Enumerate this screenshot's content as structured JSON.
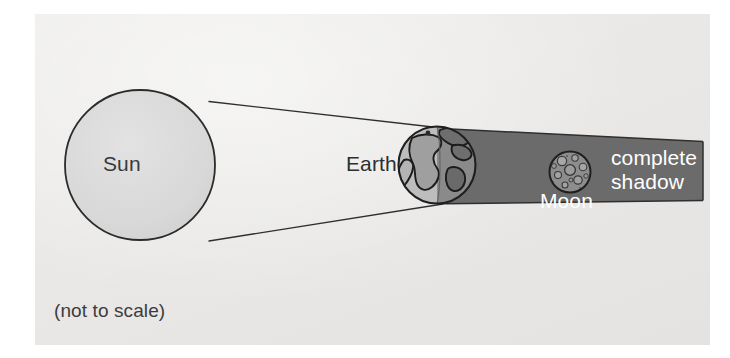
{
  "diagram": {
    "type": "astronomy-diagram",
    "caption": "(not to scale)",
    "background_color": "#f0efed",
    "bodies": [
      {
        "name": "Sun",
        "label": "Sun",
        "icon": "sun-circle-icon",
        "cx": 140,
        "cy": 165,
        "r": 75,
        "fill": "#d9d9d9",
        "stroke": "#2b2b2b"
      },
      {
        "name": "Earth",
        "label": "Earth",
        "icon": "earth-globe-icon",
        "cx": 437,
        "cy": 165,
        "r": 39,
        "fill_lit": "#b7b7b7",
        "fill_dark": "#7a7a7a",
        "stroke": "#1f1f1f"
      },
      {
        "name": "Moon",
        "label": "Moon",
        "icon": "moon-cratered-circle-icon",
        "cx": 570,
        "cy": 172,
        "r": 21,
        "fill": "#8f8f8f",
        "stroke": "#1f1f1f"
      }
    ],
    "shadow": {
      "label": "complete shadow",
      "color": "#6b6b6b",
      "stroke": "#2b2b2b",
      "note": "umbra cone cast behind Earth, narrowing to the right"
    },
    "rays": {
      "stroke": "#2b2b2b",
      "upper_tangent": {
        "x1": 212,
        "y1": 103,
        "x2": 703,
        "y2": 142
      },
      "lower_tangent": {
        "x1": 212,
        "y1": 242,
        "x2": 703,
        "y2": 200
      }
    }
  }
}
